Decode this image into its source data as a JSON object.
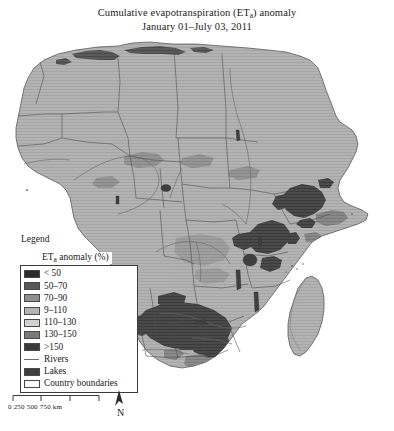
{
  "figure": {
    "title_line1_pre": "Cumulative evapotranspiration (ET",
    "title_line1_sub": "a",
    "title_line1_post": ") anomaly",
    "title_line2": "January 01–July 03, 2011"
  },
  "legend": {
    "heading": "Legend",
    "subheading_pre": "ET",
    "subheading_sub": "a",
    "subheading_post": " anomaly (%)",
    "items": [
      {
        "label": "< 50",
        "color": "#2b2b2b",
        "type": "swatch"
      },
      {
        "label": "50–70",
        "color": "#585858",
        "type": "swatch"
      },
      {
        "label": "70–90",
        "color": "#8f8f8f",
        "type": "swatch"
      },
      {
        "label": "9–110",
        "color": "#b4b4b4",
        "type": "swatch"
      },
      {
        "label": "110–130",
        "color": "#d2d2d2",
        "type": "swatch"
      },
      {
        "label": "130–150",
        "color": "#7a7a7a",
        "type": "swatch"
      },
      {
        "label": ">150",
        "color": "#3a3a3a",
        "type": "swatch"
      },
      {
        "label": "Rivers",
        "color": "#6d6d6d",
        "type": "line"
      },
      {
        "label": "Lakes",
        "color": "#3f3f3f",
        "type": "swatch"
      },
      {
        "label": "Country boundaries",
        "color": "#ffffff",
        "type": "swatch"
      }
    ]
  },
  "scale": {
    "labels": "0  250 500 750 km",
    "ticks": [
      "0",
      "250",
      "500",
      "750"
    ],
    "unit": "km",
    "north_label": "N"
  },
  "map": {
    "region": "Africa",
    "land_fill": "#b0b0b0",
    "ocean_fill": "#ffffff",
    "boundary_color": "#4e4e4e",
    "coast_color": "#4a4a4a",
    "river_color": "#6b6b6b",
    "anomaly_dark": "#3c3c3c",
    "anomaly_mid": "#6f6f6f"
  }
}
